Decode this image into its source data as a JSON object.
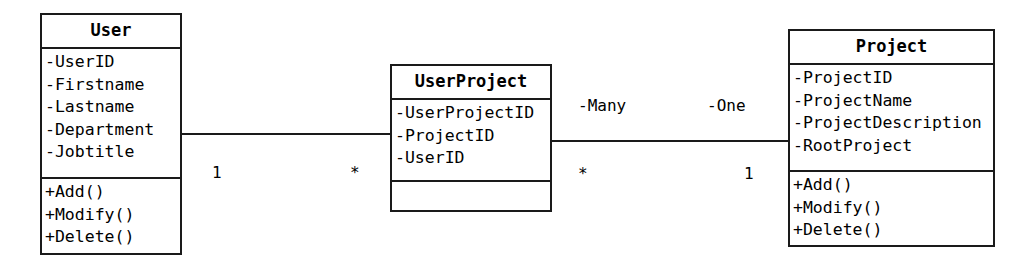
{
  "diagram": {
    "type": "uml-class-diagram",
    "classes": [
      {
        "name": "User",
        "attributes": [
          "-UserID",
          "-Firstname",
          "-Lastname",
          "-Department",
          "-Jobtitle"
        ],
        "methods": [
          "+Add()",
          "+Modify()",
          "+Delete()"
        ]
      },
      {
        "name": "UserProject",
        "attributes": [
          "-UserProjectID",
          "-ProjectID",
          "-UserID"
        ],
        "methods": []
      },
      {
        "name": "Project",
        "attributes": [
          "-ProjectID",
          "-ProjectName",
          "-ProjectDescription",
          "-RootProject"
        ],
        "methods": [
          "+Add()",
          "+Modify()",
          "+Delete()"
        ]
      }
    ],
    "associations": [
      {
        "from": "User",
        "to": "UserProject",
        "source_multiplicity": "1",
        "target_multiplicity": "*",
        "source_role": "",
        "target_role": ""
      },
      {
        "from": "UserProject",
        "to": "Project",
        "source_multiplicity": "*",
        "target_multiplicity": "1",
        "source_role": "-Many",
        "target_role": "-One"
      }
    ],
    "colors": {
      "stroke": "#1a1a1a",
      "fill": "#ffffff",
      "text": "#000000"
    }
  }
}
